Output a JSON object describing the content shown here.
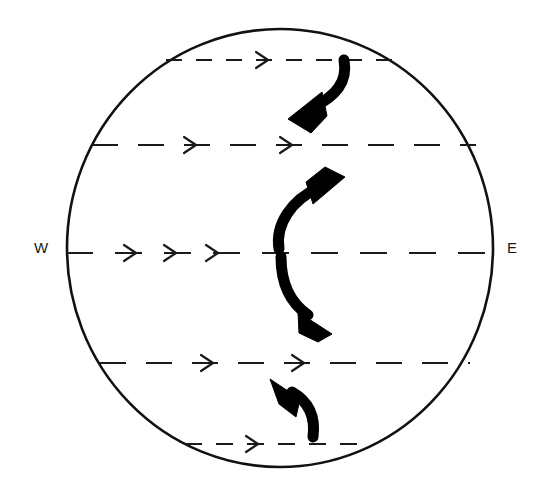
{
  "figure": {
    "kind": "schematic-diagram",
    "background_color": "#ffffff",
    "ink_color": "#111111"
  },
  "labels": {
    "west": "W",
    "east": "E"
  },
  "globe": {
    "name": "globe-outline",
    "cx": 280,
    "cy": 248,
    "rx": 213,
    "ry": 219,
    "stroke": "#111111",
    "stroke_width": 2.6
  },
  "chart_data": {
    "type": "diagram",
    "title": "",
    "xlabel": "",
    "ylabel": "",
    "grid": false,
    "legend": "none",
    "annotations": [
      "W",
      "E"
    ],
    "zonal_lines": [
      {
        "id": "zonal-line-1",
        "latitude_band": "high-north",
        "y": 60,
        "x_start": 166,
        "x_end": 404,
        "dash": "16 14",
        "arrow_count": 1,
        "arrow_x": [
          268
        ],
        "direction": "eastward"
      },
      {
        "id": "zonal-line-2",
        "latitude_band": "mid-north",
        "y": 145,
        "x_start": 92,
        "x_end": 476,
        "dash": "26 20",
        "arrow_count": 2,
        "arrow_x": [
          196,
          292
        ],
        "direction": "eastward"
      },
      {
        "id": "zonal-line-3",
        "latitude_band": "equator",
        "y": 253,
        "x_start": 66,
        "x_end": 492,
        "dash": "27 22",
        "arrow_count": 3,
        "arrow_x": [
          136,
          176,
          218
        ],
        "direction": "eastward"
      },
      {
        "id": "zonal-line-4",
        "latitude_band": "mid-south",
        "y": 363,
        "x_start": 100,
        "x_end": 470,
        "dash": "26 20",
        "arrow_count": 2,
        "arrow_x": [
          213,
          304
        ],
        "direction": "eastward"
      },
      {
        "id": "zonal-line-5",
        "latitude_band": "high-south",
        "y": 444,
        "x_start": 185,
        "x_end": 357,
        "dash": "17 14",
        "arrow_count": 1,
        "arrow_x": [
          258
        ],
        "direction": "eastward"
      }
    ],
    "overturning_arrows": [
      {
        "id": "overturning-arrow-1",
        "position": "upper",
        "direction": "down-left",
        "start": [
          345,
          62
        ],
        "end": [
          296,
          112
        ],
        "stroke_width": 11,
        "description": "curves from high-north band downward and to the left"
      },
      {
        "id": "overturning-arrow-2",
        "position": "upper-middle",
        "direction": "up-right",
        "start": [
          278,
          248
        ],
        "end": [
          340,
          180
        ],
        "stroke_width": 11,
        "description": "rises from the equator upward and to the right"
      },
      {
        "id": "overturning-arrow-3",
        "position": "lower-middle",
        "direction": "down-right",
        "start": [
          280,
          258
        ],
        "end": [
          325,
          325
        ],
        "stroke_width": 11,
        "description": "descends from the equator downward and to the right"
      },
      {
        "id": "overturning-arrow-4",
        "position": "lower",
        "direction": "up-left",
        "start": [
          314,
          438
        ],
        "end": [
          276,
          384
        ],
        "stroke_width": 11,
        "description": "rises from high-south band upward and to the left"
      }
    ]
  },
  "label_positions": {
    "west": {
      "x": 41,
      "y": 249
    },
    "east": {
      "x": 512,
      "y": 249
    }
  }
}
